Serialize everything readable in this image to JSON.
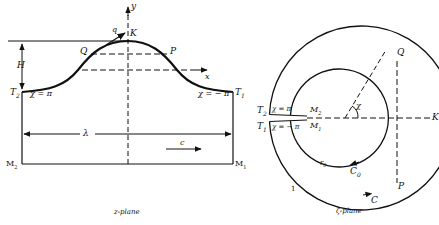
{
  "z_plane": {
    "caption": "z-plane",
    "axis_x": "x",
    "axis_y": "y",
    "height_label": "H",
    "wavelength_label": "λ",
    "velocity_label": "c",
    "speed_label": "q",
    "points": {
      "K": "K",
      "P": "P",
      "Q": "Q",
      "T1": "T",
      "T1_sub": "1",
      "T2": "T",
      "T2_sub": "2",
      "M1": "M",
      "M1_sub": "1",
      "M2": "M",
      "M2_sub": "2"
    },
    "chi_left": "χ = π",
    "chi_right": "χ = − π"
  },
  "zeta_plane": {
    "caption": "ζ-plane",
    "outer_circle_label": "C",
    "inner_circle_label": "C",
    "inner_circle_sub": "0",
    "inner_radius_label": "r",
    "inner_radius_sub": "0",
    "outer_radius_value": "1",
    "angle_label": "χ",
    "points": {
      "K": "K",
      "P": "P",
      "Q": "Q",
      "T1": "T",
      "T1_sub": "1",
      "T2": "T",
      "T2_sub": "2",
      "M1": "M",
      "M1_sub": "1",
      "M2": "M",
      "M2_sub": "2"
    },
    "chi_upper": "χ = π",
    "chi_lower": "χ = − π"
  }
}
